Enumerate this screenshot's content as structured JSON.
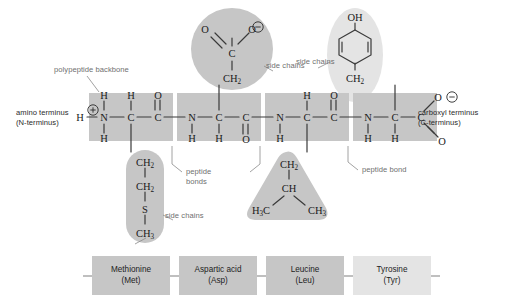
{
  "figure": {
    "colors": {
      "backbone_highlight": "#c6c6c6",
      "sidechain_highlight": "#c6c6c6",
      "sidechain_highlight_light": "#e4e4e4",
      "label_gray": "#6f6f6f",
      "label_dark": "#2b2b2b",
      "bond_line": "#3a3a3a",
      "background": "#ffffff"
    }
  },
  "annotations": {
    "polypeptide_backbone": "polypeptide backbone",
    "amino_terminus_line1": "amino terminus",
    "amino_terminus_line2": "(N-terminus)",
    "carboxyl_terminus_line1": "carboxyl terminus",
    "carboxyl_terminus_line2": "(C-terminus)",
    "side_chains_top": "side chains",
    "side_chains_right": "side chains",
    "side_chains_bottom": "side chains",
    "peptide_bonds_line1": "peptide",
    "peptide_bonds_line2": "bonds",
    "peptide_bond": "peptide bond"
  },
  "backbone": {
    "n_terminus_h": "H",
    "residues": [
      {
        "name": "methionine",
        "n_atom": "N",
        "n_charge": "⊕",
        "n_h_top": "H",
        "n_h_bottom": "H",
        "alpha_c": "C",
        "alpha_h": "H",
        "alpha_h_position": "top",
        "carbonyl_c": "C",
        "carbonyl_o": "O",
        "carbonyl_o_position": "top"
      },
      {
        "name": "aspartic acid",
        "n_atom": "N",
        "n_h_bottom": "H",
        "alpha_c": "C",
        "alpha_h": "H",
        "alpha_h_position": "bottom",
        "carbonyl_c": "C",
        "carbonyl_o": "O",
        "carbonyl_o_position": "bottom"
      },
      {
        "name": "leucine",
        "n_atom": "N",
        "n_h_bottom": "H",
        "alpha_c": "C",
        "alpha_h": "H",
        "alpha_h_position": "top",
        "carbonyl_c": "C",
        "carbonyl_o": "O",
        "carbonyl_o_position": "top"
      },
      {
        "name": "tyrosine",
        "n_atom": "N",
        "n_h_bottom": "H",
        "alpha_c": "C",
        "alpha_h": "H",
        "alpha_h_position": "bottom",
        "carboxylate_c": "C",
        "carboxylate_o_single": "O",
        "carboxylate_charge": "⊖",
        "carboxylate_o_double": "O"
      }
    ]
  },
  "side_chains": {
    "methionine": {
      "atoms": [
        "CH₂",
        "CH₂",
        "S",
        "CH₃"
      ],
      "shape": "capsule",
      "position": "below"
    },
    "aspartic_acid": {
      "atoms": [
        "CH₂",
        "C"
      ],
      "carboxylate_o_double": "O",
      "carboxylate_o_single": "O",
      "carboxylate_charge": "⊖",
      "shape": "circle",
      "position": "above"
    },
    "leucine": {
      "atoms": [
        "CH₂",
        "CH"
      ],
      "methyl_left": "H₃C",
      "methyl_right": "CH₃",
      "shape": "triangle",
      "position": "below"
    },
    "tyrosine": {
      "hydroxyl": "OH",
      "ring": "benzene",
      "atoms": [
        "CH₂"
      ],
      "shape": "ellipse",
      "position": "above"
    }
  },
  "residue_labels": [
    {
      "name": "Methionine",
      "abbrev": "(Met)",
      "tone": "dark"
    },
    {
      "name": "Aspartic acid",
      "abbrev": "(Asp)",
      "tone": "dark"
    },
    {
      "name": "Leucine",
      "abbrev": "(Leu)",
      "tone": "dark"
    },
    {
      "name": "Tyrosine",
      "abbrev": "(Tyr)",
      "tone": "light"
    }
  ]
}
